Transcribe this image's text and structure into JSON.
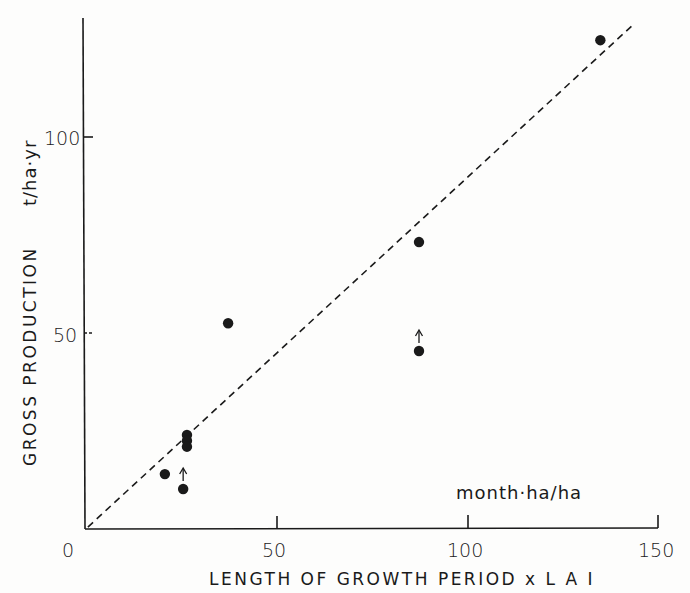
{
  "chart_data": {
    "type": "scatter",
    "title": "",
    "xlabel": "LENGTH OF GROWTH PERIOD x L A I",
    "ylabel": "GROSS PRODUCTION",
    "x_unit": "month·ha/ha",
    "y_unit": "t/ha·yr",
    "xlim": [
      0,
      150
    ],
    "ylim": [
      0,
      130
    ],
    "x_ticks": [
      0,
      50,
      100,
      150
    ],
    "y_ticks": [
      0,
      50,
      100
    ],
    "x_tick_labels": [
      "0",
      "50",
      "100",
      "150"
    ],
    "y_tick_labels": [
      "0",
      "50",
      "100"
    ],
    "grid": false,
    "legend": null,
    "series": [
      {
        "name": "observations",
        "marker": "filled-circle",
        "points": [
          {
            "x": 20.7,
            "y": 14.0,
            "lower_bound": false
          },
          {
            "x": 25.5,
            "y": 10.2,
            "lower_bound": true
          },
          {
            "x": 26.5,
            "y": 24.0,
            "lower_bound": false
          },
          {
            "x": 26.5,
            "y": 22.5,
            "lower_bound": false
          },
          {
            "x": 26.5,
            "y": 21.0,
            "lower_bound": false
          },
          {
            "x": 37.3,
            "y": 52.5,
            "lower_bound": false
          },
          {
            "x": 87.4,
            "y": 73.2,
            "lower_bound": false
          },
          {
            "x": 87.4,
            "y": 45.4,
            "lower_bound": true
          },
          {
            "x": 135.0,
            "y": 124.7,
            "lower_bound": false
          }
        ]
      }
    ],
    "reference_line": {
      "style": "dashed",
      "from": {
        "x": 0.5,
        "y": 0.5
      },
      "to": {
        "x": 144,
        "y": 129
      }
    },
    "annotations": [
      {
        "text": "↑",
        "meaning": "lower-bound arrow above point (25.5, 10.2)"
      },
      {
        "text": "↑",
        "meaning": "lower-bound arrow above point (87.4, 45.4)"
      }
    ]
  },
  "labels": {
    "x_title": "LENGTH OF GROWTH PERIOD x L A I",
    "y_title": "GROSS PRODUCTION",
    "y_unit": "t/ha·yr",
    "x_unit": "month·ha/ha",
    "x0": "0",
    "x50": "50",
    "x100": "100",
    "x150": "150",
    "y50": "50",
    "y100": "100"
  },
  "colors": {
    "ink": "#1a1a1a",
    "background": "#fdfdfc"
  }
}
